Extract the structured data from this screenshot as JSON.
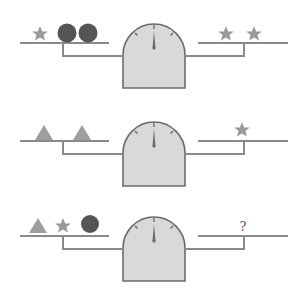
{
  "puzzle": {
    "description": "Balance scale puzzle with three scales",
    "colors": {
      "line": "#8a8a8a",
      "scale_fill": "#d9d9d9",
      "scale_stroke": "#6b6b6b",
      "star": "#9a9a9a",
      "circle": "#555555",
      "triangle": "#9e9e9e",
      "needle": "#6b6b6b"
    },
    "scales": [
      {
        "left": [
          "star",
          "circle",
          "circle"
        ],
        "right": [
          "star",
          "star"
        ],
        "balanced": true
      },
      {
        "left": [
          "triangle",
          "triangle"
        ],
        "right": [
          "star"
        ],
        "balanced": true
      },
      {
        "left": [
          "triangle",
          "star",
          "circle"
        ],
        "right": [
          "?"
        ],
        "balanced": true
      }
    ],
    "unknown_label": "?"
  }
}
